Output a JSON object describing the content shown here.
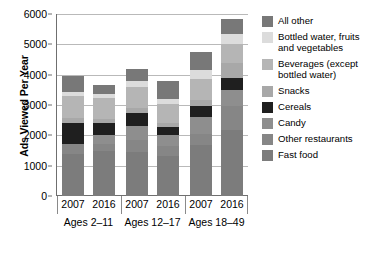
{
  "chart_data": {
    "type": "bar",
    "subtype": "stacked-bar",
    "title": "",
    "xlabel": "",
    "ylabel": "Ads Viewed Per Year",
    "ylim": [
      0,
      6000
    ],
    "yticks": [
      0,
      1000,
      2000,
      3000,
      4000,
      5000,
      6000
    ],
    "ytick_labels": [
      "0",
      "1000",
      "2000",
      "3000",
      "4000",
      "5000",
      "6000"
    ],
    "grid": true,
    "legend_position": "right",
    "categories": [
      "2007",
      "2016",
      "2007",
      "2016",
      "2007",
      "2016"
    ],
    "groups": [
      {
        "label": "Ages 2–11",
        "bars": [
          0,
          1
        ]
      },
      {
        "label": "Ages 12–17",
        "bars": [
          2,
          3
        ]
      },
      {
        "label": "Ages 18–49",
        "bars": [
          4,
          5
        ]
      }
    ],
    "series": [
      {
        "name": "Fast food",
        "color": "#7c7c7c",
        "values": [
          1380,
          1480,
          1450,
          1330,
          1670,
          2160
        ]
      },
      {
        "name": "Other restaurants",
        "color": "#868686",
        "values": [
          350,
          250,
          400,
          330,
          390,
          800
        ]
      },
      {
        "name": "Candy",
        "color": "#8e8e8e",
        "values": [
          0,
          270,
          460,
          360,
          540,
          540
        ]
      },
      {
        "name": "Cereals",
        "color": "#1f1f1f",
        "values": [
          680,
          420,
          420,
          240,
          380,
          380
        ]
      },
      {
        "name": "Snacks",
        "color": "#a8a8a8",
        "values": [
          150,
          120,
          180,
          150,
          190,
          520
        ]
      },
      {
        "name": "Beverages (except bottled water)",
        "color": "#b5b5b5",
        "values": [
          740,
          700,
          690,
          620,
          680,
          620
        ]
      },
      {
        "name": "Bottled water, fruits and vegetables",
        "color": "#dcdcdc",
        "values": [
          140,
          110,
          190,
          160,
          320,
          320
        ]
      },
      {
        "name": "All other",
        "color": "#787878",
        "values": [
          530,
          300,
          390,
          600,
          590,
          480
        ]
      }
    ],
    "totals": [
      3970,
      3650,
      4180,
      3790,
      4760,
      5820
    ]
  },
  "legend": {
    "items": [
      {
        "label": "All other",
        "color": "#787878"
      },
      {
        "label": "Bottled water, fruits and vegetables",
        "color": "#dcdcdc"
      },
      {
        "label": "Beverages (except bottled water)",
        "color": "#b5b5b5"
      },
      {
        "label": "Snacks",
        "color": "#a8a8a8"
      },
      {
        "label": "Cereals",
        "color": "#1f1f1f"
      },
      {
        "label": "Candy",
        "color": "#8e8e8e"
      },
      {
        "label": "Other restaurants",
        "color": "#868686"
      },
      {
        "label": "Fast food",
        "color": "#7c7c7c"
      }
    ]
  }
}
